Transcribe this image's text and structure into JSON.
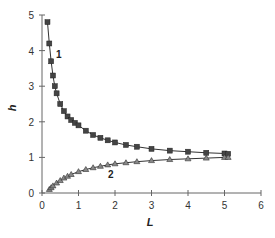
{
  "chart_data": {
    "type": "scatter",
    "title": "",
    "xlabel": "L",
    "ylabel": "h",
    "xlim": [
      0,
      6
    ],
    "ylim": [
      0,
      5
    ],
    "xticks": [
      "0",
      "1",
      "2",
      "3",
      "4",
      "5",
      "6"
    ],
    "yticks": [
      "0",
      "1",
      "2",
      "3",
      "4",
      "5"
    ],
    "grid": false,
    "legend": "none",
    "annotations": [
      {
        "text": "1",
        "near": "series 1 at L≈0.3, h≈4"
      },
      {
        "text": "2",
        "near": "series 2 at L≈2, h≈0.6"
      }
    ],
    "series": [
      {
        "name": "1",
        "marker": "square",
        "color": "#333333",
        "x": [
          0.15,
          0.2,
          0.25,
          0.3,
          0.35,
          0.4,
          0.5,
          0.6,
          0.7,
          0.8,
          0.9,
          1.0,
          1.2,
          1.4,
          1.6,
          1.8,
          2.0,
          2.3,
          2.6,
          3.0,
          3.5,
          4.0,
          4.5,
          5.0,
          5.1
        ],
        "y": [
          4.8,
          4.2,
          3.7,
          3.3,
          3.0,
          2.8,
          2.5,
          2.3,
          2.15,
          2.05,
          1.97,
          1.9,
          1.75,
          1.63,
          1.55,
          1.48,
          1.42,
          1.35,
          1.3,
          1.24,
          1.19,
          1.16,
          1.13,
          1.11,
          1.1
        ]
      },
      {
        "name": "2",
        "marker": "triangle",
        "color": "#333333",
        "x": [
          0.2,
          0.25,
          0.3,
          0.4,
          0.5,
          0.6,
          0.7,
          0.8,
          1.0,
          1.2,
          1.4,
          1.6,
          1.8,
          2.0,
          2.3,
          2.6,
          3.0,
          3.5,
          4.0,
          4.5,
          5.0,
          5.1
        ],
        "y": [
          0.1,
          0.15,
          0.2,
          0.28,
          0.35,
          0.42,
          0.47,
          0.52,
          0.6,
          0.66,
          0.71,
          0.75,
          0.79,
          0.82,
          0.85,
          0.88,
          0.91,
          0.94,
          0.96,
          0.98,
          1.0,
          1.0
        ]
      }
    ]
  }
}
